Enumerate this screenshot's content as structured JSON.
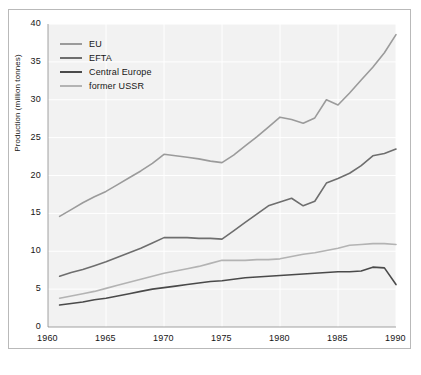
{
  "chart_data": {
    "type": "line",
    "title": "",
    "xlabel": "",
    "ylabel": "Production (million tonnes)",
    "xlim": [
      1960,
      1990
    ],
    "ylim": [
      0,
      40
    ],
    "xticks": [
      1960,
      1965,
      1970,
      1975,
      1980,
      1985,
      1990
    ],
    "yticks": [
      0,
      5,
      10,
      15,
      20,
      25,
      30,
      35,
      40
    ],
    "xtick_labels": [
      "1960",
      "1965",
      "1970",
      "1975",
      "1980",
      "1985",
      "1990"
    ],
    "ytick_labels": [
      "0",
      "5",
      "10",
      "15",
      "20",
      "25",
      "30",
      "35",
      "40"
    ],
    "grid": true,
    "grid_color": "#ffffff",
    "plot_background": "#f2f2f2",
    "legend_position": "top-left",
    "x": [
      1961,
      1962,
      1963,
      1964,
      1965,
      1966,
      1967,
      1968,
      1969,
      1970,
      1971,
      1972,
      1973,
      1974,
      1975,
      1976,
      1977,
      1978,
      1979,
      1980,
      1981,
      1982,
      1983,
      1984,
      1985,
      1986,
      1987,
      1988,
      1989,
      1990
    ],
    "series": [
      {
        "name": "EU",
        "color": "#9b9b9b",
        "values": [
          14.6,
          15.5,
          16.4,
          17.2,
          17.9,
          18.8,
          19.7,
          20.6,
          21.6,
          22.8,
          22.6,
          22.4,
          22.2,
          21.9,
          21.7,
          22.7,
          23.9,
          25.1,
          26.4,
          27.7,
          27.4,
          26.9,
          27.6,
          30.0,
          29.3,
          30.9,
          32.6,
          34.3,
          36.2,
          38.6
        ]
      },
      {
        "name": "EFTA",
        "color": "#6e6e6e",
        "values": [
          6.7,
          7.2,
          7.6,
          8.1,
          8.6,
          9.2,
          9.8,
          10.4,
          11.1,
          11.8,
          11.8,
          11.8,
          11.7,
          11.7,
          11.6,
          12.7,
          13.8,
          14.9,
          16.0,
          16.5,
          17.0,
          16.0,
          16.6,
          19.0,
          19.6,
          20.3,
          21.3,
          22.6,
          22.9,
          23.5
        ]
      },
      {
        "name": "Central Europe",
        "color": "#4a4a4a",
        "values": [
          2.9,
          3.1,
          3.3,
          3.6,
          3.8,
          4.1,
          4.4,
          4.7,
          5.0,
          5.2,
          5.4,
          5.6,
          5.8,
          6.0,
          6.1,
          6.3,
          6.5,
          6.6,
          6.7,
          6.8,
          6.9,
          7.0,
          7.1,
          7.2,
          7.3,
          7.3,
          7.4,
          7.9,
          7.8,
          5.6
        ]
      },
      {
        "name": "former USSR",
        "color": "#b3b3b3",
        "values": [
          3.8,
          4.1,
          4.4,
          4.7,
          5.1,
          5.5,
          5.9,
          6.3,
          6.7,
          7.1,
          7.4,
          7.7,
          8.0,
          8.4,
          8.8,
          8.8,
          8.8,
          8.9,
          8.9,
          9.0,
          9.3,
          9.6,
          9.8,
          10.1,
          10.4,
          10.8,
          10.9,
          11.0,
          11.0,
          10.9
        ]
      }
    ]
  },
  "legend": {
    "items": [
      {
        "label": "EU"
      },
      {
        "label": "EFTA"
      },
      {
        "label": "Central Europe"
      },
      {
        "label": "former USSR"
      }
    ]
  }
}
